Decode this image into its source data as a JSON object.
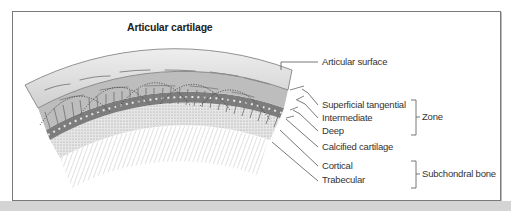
{
  "title": "Articular cartilage",
  "labels": {
    "articular_surface": "Articular surface",
    "superficial_tangential": "Superficial tangential",
    "intermediate": "Intermediate",
    "deep": "Deep",
    "calcified_cartilage": "Calcified cartilage",
    "cortical": "Cortical",
    "trabecular": "Trabecular"
  },
  "groups": {
    "zone": "Zone",
    "subchondral_bone": "Subchondral bone"
  },
  "colors": {
    "cartilage": "#d9d9d9",
    "collagen": "#8c8c8c",
    "bone": "#bdbdbd",
    "line": "#555555"
  }
}
